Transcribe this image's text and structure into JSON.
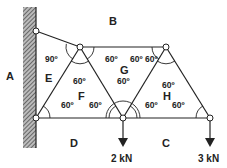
{
  "diagram": {
    "type": "pin-jointed truss attached to wall",
    "regions": {
      "A": "A",
      "B": "B",
      "C": "C",
      "D": "D",
      "E": "E",
      "F": "F",
      "G": "G",
      "H": "H"
    },
    "angles": {
      "top_left": "90º",
      "e_top": "60º",
      "g_left": "60º",
      "g_right": "60º",
      "f_top": "60º",
      "f_left": "60º",
      "f_right": "60º",
      "g_bottom": "60º",
      "h_top": "60º",
      "h_left": "60º",
      "h_right": "60º"
    },
    "loads": {
      "middle": "2 kN",
      "right": "3 kN"
    },
    "colors": {
      "line": "#222222",
      "wall_hatch": "#555555",
      "node_fill": "#ffffff"
    }
  }
}
